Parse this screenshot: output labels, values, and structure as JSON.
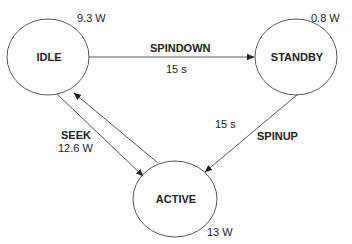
{
  "diagram": {
    "type": "state-transition",
    "states": [
      {
        "id": "idle",
        "label": "IDLE",
        "power": "9.3 W"
      },
      {
        "id": "standby",
        "label": "STANDBY",
        "power": "0.8 W"
      },
      {
        "id": "active",
        "label": "ACTIVE",
        "power": "13 W"
      }
    ],
    "transitions": [
      {
        "id": "spindown",
        "from": "idle",
        "to": "standby",
        "label": "SPINDOWN",
        "detail": "15 s"
      },
      {
        "id": "spinup",
        "from": "standby",
        "to": "active",
        "label": "SPINUP",
        "detail": "15 s"
      },
      {
        "id": "seek",
        "from": "idle",
        "to": "active",
        "label": "SEEK",
        "detail": "12.6 W",
        "bidirectional": true
      }
    ],
    "colors": {
      "stroke": "#333333",
      "text": "#222222",
      "background": "#ffffff"
    }
  }
}
